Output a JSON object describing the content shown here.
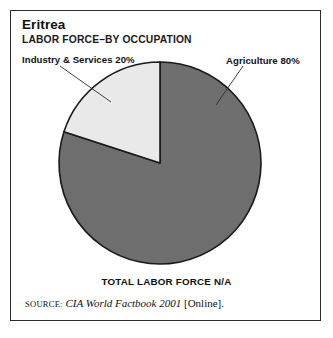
{
  "chart_data": {
    "type": "pie",
    "title": "Eritrea",
    "subtitle": "LABOR FORCE–BY OCCUPATION",
    "categories": [
      "Agriculture",
      "Industry & Services"
    ],
    "values": [
      80,
      20
    ],
    "value_unit": "%",
    "labels": [
      "Agriculture 80%",
      "Industry & Services 20%"
    ],
    "slice_colors": [
      "#6e6e6e",
      "#e9e9e9"
    ],
    "legend": "none",
    "grid": false,
    "start_angle_deg": 90,
    "direction": "counterclockwise",
    "footnote": "TOTAL LABOR FORCE N/A",
    "source": {
      "keyword": "Source:",
      "work": "CIA World Factbook 2001",
      "medium": "[Online]."
    }
  },
  "figure": {
    "title": "Eritrea",
    "subtitle": "LABOR FORCE–BY OCCUPATION",
    "label_industry": "Industry & Services 20%",
    "label_agriculture": "Agriculture 80%",
    "footer_total": "TOTAL LABOR FORCE N/A",
    "source_keyword": "Source:",
    "source_work": "CIA World Factbook 2001",
    "source_medium": "[Online]."
  },
  "colors": {
    "slice_agriculture": "#6e6e6e",
    "slice_industry": "#e9e9e9",
    "outline": "#1a1a1a",
    "frame": "#2b2b2b",
    "background": "#ffffff"
  }
}
